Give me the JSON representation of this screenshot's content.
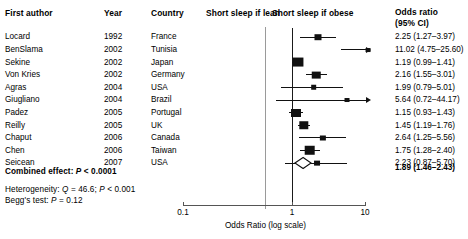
{
  "columns": {
    "author_header": "First author",
    "year_header": "Year",
    "country_header": "Country",
    "or_header_line1": "Odds ratio",
    "or_header_line2": "(95% CI)"
  },
  "plot_headers": {
    "left_label": "Short sleep if lean",
    "right_label": "Short sleep if obese"
  },
  "axis": {
    "title": "Odds Ratio (log scale)",
    "ticks": [
      {
        "label": "0.1",
        "value": 0.1
      },
      {
        "label": "1",
        "value": 1
      },
      {
        "label": "10",
        "value": 10
      }
    ],
    "min": 0.1,
    "max": 10,
    "scale": "log"
  },
  "footer": {
    "combined_label": "Combined effect:",
    "combined_p_italic": "P",
    "combined_p_value": "< 0.0001",
    "heterogeneity_label": "Heterogeneity:",
    "heterogeneity_q_italic": "Q",
    "heterogeneity_q_value": "= 46.6;",
    "heterogeneity_p_italic": "P",
    "heterogeneity_p_value": "< 0.001",
    "beggs_label": "Begg's test:",
    "beggs_p_italic": "P",
    "beggs_p_value": "= 0.12"
  },
  "chart_data": {
    "type": "forest",
    "title": "",
    "xlabel": "Odds Ratio (log scale)",
    "ylabel": "",
    "xscale": "log",
    "xlim": [
      0.1,
      10
    ],
    "xticks": [
      0.1,
      1,
      10
    ],
    "null_value": 1,
    "left_annotation": "Short sleep if lean",
    "right_annotation": "Short sleep if obese",
    "columns": [
      "First author",
      "Year",
      "Country",
      "Odds ratio (95% CI)"
    ],
    "studies": [
      {
        "author": "Locard",
        "year": "1992",
        "country": "France",
        "or": 2.25,
        "ci_low": 1.27,
        "ci_high": 3.97,
        "or_text": "2.25 (1.27–3.97)",
        "weight": 0.4,
        "clipped_high": false
      },
      {
        "author": "BenSlama",
        "year": "2002",
        "country": "Tunisia",
        "or": 11.02,
        "ci_low": 4.75,
        "ci_high": 25.6,
        "or_text": "11.02 (4.75–25.60)",
        "weight": 0.12,
        "clipped_high": true
      },
      {
        "author": "Sekine",
        "year": "2002",
        "country": "Japan",
        "or": 1.19,
        "ci_low": 0.99,
        "ci_high": 1.41,
        "or_text": "1.19 (0.99–1.41)",
        "weight": 0.95,
        "clipped_high": false
      },
      {
        "author": "Von Kries",
        "year": "2002",
        "country": "Germany",
        "or": 2.16,
        "ci_low": 1.55,
        "ci_high": 3.01,
        "or_text": "2.16 (1.55–3.01)",
        "weight": 0.6,
        "clipped_high": false
      },
      {
        "author": "Agras",
        "year": "2004",
        "country": "USA",
        "or": 1.99,
        "ci_low": 0.79,
        "ci_high": 5.01,
        "or_text": "1.99 (0.79–5.01)",
        "weight": 0.22,
        "clipped_high": false
      },
      {
        "author": "Giugliano",
        "year": "2004",
        "country": "Brazil",
        "or": 5.64,
        "ci_low": 0.72,
        "ci_high": 44.17,
        "or_text": "5.64 (0.72–44.17)",
        "weight": 0.13,
        "clipped_high": true
      },
      {
        "author": "Padez",
        "year": "2005",
        "country": "Portugal",
        "or": 1.15,
        "ci_low": 0.93,
        "ci_high": 1.43,
        "or_text": "1.15 (0.93–1.43)",
        "weight": 0.8,
        "clipped_high": false
      },
      {
        "author": "Reilly",
        "year": "2005",
        "country": "UK",
        "or": 1.45,
        "ci_low": 1.19,
        "ci_high": 1.76,
        "or_text": "1.45 (1.19–1.76)",
        "weight": 0.72,
        "clipped_high": false
      },
      {
        "author": "Chaput",
        "year": "2006",
        "country": "Canada",
        "or": 2.64,
        "ci_low": 1.25,
        "ci_high": 5.56,
        "or_text": "2.64 (1.25–5.56)",
        "weight": 0.3,
        "clipped_high": false
      },
      {
        "author": "Chen",
        "year": "2006",
        "country": "Taiwan",
        "or": 1.75,
        "ci_low": 1.28,
        "ci_high": 2.4,
        "or_text": "1.75 (1.28–2.40)",
        "weight": 0.88,
        "clipped_high": false
      },
      {
        "author": "Seicean",
        "year": "2007",
        "country": "USA",
        "or": 2.23,
        "ci_low": 0.87,
        "ci_high": 5.7,
        "or_text": "2.23 (0.87–5.70)",
        "weight": 0.26,
        "clipped_high": false
      }
    ],
    "summary": {
      "label": "Combined effect",
      "or": 1.89,
      "ci_low": 1.46,
      "ci_high": 2.43,
      "or_text": "1.89 (1.46–2.43)",
      "p_text": "P < 0.0001"
    },
    "statistics": {
      "heterogeneity_Q": 46.6,
      "heterogeneity_P": "< 0.001",
      "beggs_test_P": 0.12
    }
  }
}
